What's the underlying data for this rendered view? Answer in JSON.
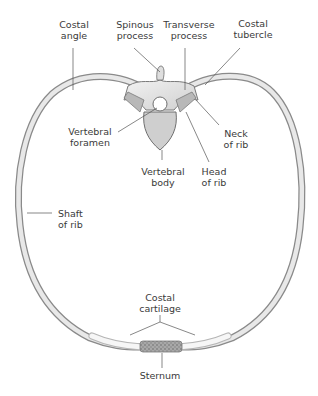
{
  "figure": {
    "colors": {
      "bone_fill": "#e6e6e6",
      "bone_edge": "#8a8a8a",
      "bone_dark": "#6f6f6f",
      "cartilage_fill": "#f4f4f4",
      "sternum_fill": "#9a9a9a",
      "leader_line": "#555555",
      "text": "#3a3a3a"
    }
  },
  "labels": {
    "costal_angle": "Costal\nangle",
    "spinous_process": "Spinous\nprocess",
    "transverse_process": "Transverse\nprocess",
    "costal_tubercle": "Costal\ntubercle",
    "vertebral_foramen": "Vertebral\nforamen",
    "vertebral_body": "Vertebral\nbody",
    "neck_of_rib": "Neck\nof rib",
    "head_of_rib": "Head\nof rib",
    "shaft_of_rib": "Shaft\nof rib",
    "costal_cartilage": "Costal\ncartilage",
    "sternum": "Sternum"
  }
}
